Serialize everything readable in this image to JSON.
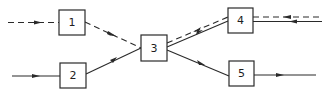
{
  "diagram": {
    "type": "flow-network",
    "nodes": [
      {
        "id": "1",
        "label": "1"
      },
      {
        "id": "2",
        "label": "2"
      },
      {
        "id": "3",
        "label": "3"
      },
      {
        "id": "4",
        "label": "4"
      },
      {
        "id": "5",
        "label": "5"
      }
    ],
    "edges": [
      {
        "from": "input",
        "to": "1",
        "style": "dashed"
      },
      {
        "from": "input",
        "to": "2",
        "style": "solid"
      },
      {
        "from": "1",
        "to": "3",
        "style": "dashed"
      },
      {
        "from": "2",
        "to": "3",
        "style": "solid"
      },
      {
        "from": "4",
        "to": "3",
        "style": "dashed"
      },
      {
        "from": "3",
        "to": "4",
        "style": "solid"
      },
      {
        "from": "output",
        "to": "4",
        "style": "dashed"
      },
      {
        "from": "output",
        "to": "4",
        "style": "solid"
      },
      {
        "from": "5",
        "to": "output",
        "style": "solid"
      }
    ]
  }
}
